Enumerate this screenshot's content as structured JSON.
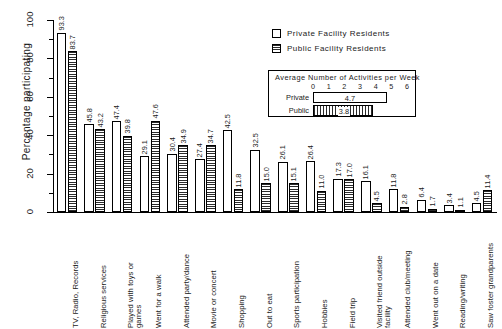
{
  "chart_data": {
    "type": "bar",
    "title": "",
    "xlabel": "",
    "ylabel": "Percentage  participating",
    "ylim": [
      0,
      100
    ],
    "yticks": [
      0,
      20,
      40,
      60,
      80,
      100
    ],
    "ytick_labels": [
      "0",
      "20",
      "40",
      "60",
      "80",
      "100"
    ],
    "grid": false,
    "legend_position": "top-center",
    "categories": [
      "TV, Radio, Records",
      "Religious services",
      "Played with toys or\ngames",
      "Went for a walk",
      "Attended party/dance",
      "Movie or concert",
      "Shopping",
      "Out to eat",
      "Sports  participation",
      "Hobbies",
      "Field trip",
      "Visited friend outside\nfacility",
      "Attended  club/meeting",
      "Went out  on a date",
      "Reading/writing",
      "Saw foster grandparents"
    ],
    "series": [
      {
        "name": "Private Facility Residents",
        "values": [
          93.3,
          45.8,
          47.4,
          29.1,
          30.4,
          27.4,
          42.5,
          32.5,
          26.1,
          26.4,
          17.3,
          16.1,
          11.8,
          6.4,
          3.4,
          4.5
        ]
      },
      {
        "name": "Public Facility Residents",
        "values": [
          83.7,
          43.2,
          39.8,
          47.6,
          34.9,
          34.7,
          11.8,
          15.0,
          15.1,
          11.0,
          17.0,
          4.5,
          2.8,
          1.7,
          1.1,
          11.4
        ]
      }
    ]
  },
  "legend": {
    "items": [
      {
        "label": "Private Facility Residents",
        "swatch": "private"
      },
      {
        "label": "Public Facility Residents",
        "swatch": "public"
      }
    ]
  },
  "inset": {
    "title": "Average  Number  of  Activities  per  Week",
    "scale_ticks": [
      "0",
      "1",
      "2",
      "3",
      "4",
      "5",
      "6"
    ],
    "scale_max": 6,
    "rows": [
      {
        "label": "Private",
        "value": "4.7",
        "numeric": 4.7,
        "style": "private"
      },
      {
        "label": "Public",
        "value": "3.8",
        "numeric": 3.8,
        "style": "public"
      }
    ]
  }
}
